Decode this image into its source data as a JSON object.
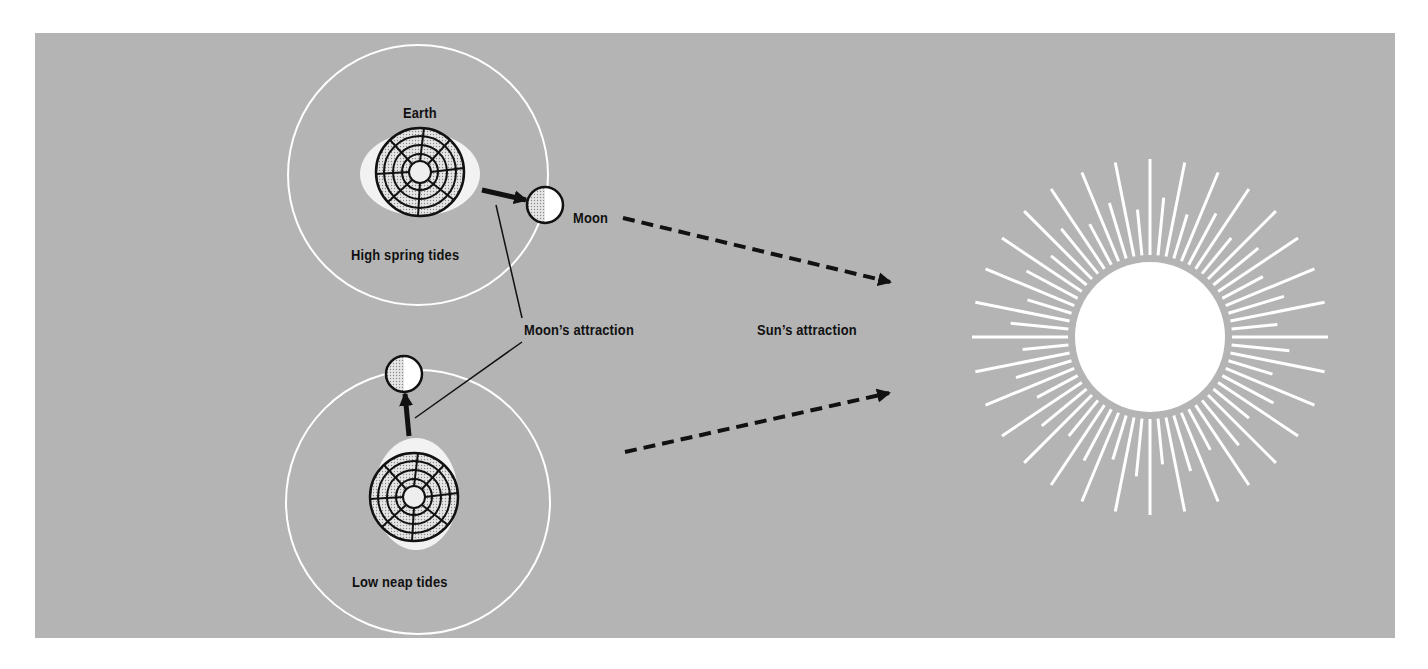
{
  "diagram": {
    "background_color": "#b4b4b4",
    "labels": {
      "earth": "Earth",
      "moon": "Moon",
      "high_spring_tides": "High spring tides",
      "low_neap_tides": "Low neap tides",
      "moons_attraction": "Moon’s attraction",
      "suns_attraction": "Sun’s attraction"
    },
    "scenes": [
      {
        "name": "spring",
        "caption": "High spring tides",
        "moon_position": "aligned with Sun"
      },
      {
        "name": "neap",
        "caption": "Low neap tides",
        "moon_position": "at right angle to Sun"
      }
    ],
    "icons": [
      "earth-globe-icon",
      "moon-icon",
      "sun-icon",
      "arrow-icon",
      "dashed-arrow-icon"
    ]
  }
}
